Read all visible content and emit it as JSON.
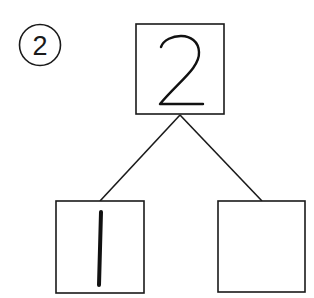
{
  "problem": {
    "number_label": "2",
    "top_box": {
      "value": "2"
    },
    "left_box": {
      "value": "1"
    },
    "right_box": {
      "value": ""
    }
  },
  "colors": {
    "stroke": "#1a1a1a",
    "background": "#ffffff"
  }
}
